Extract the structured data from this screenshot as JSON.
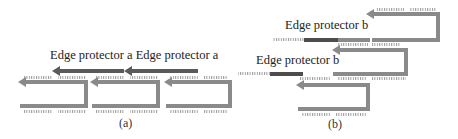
{
  "panel_a": {
    "caption": "(a)",
    "labels": [
      "Edge protector a",
      "Edge protector a"
    ],
    "label_line": "Edge protector a Edge protector a",
    "hairpin_count": 3,
    "protector_count": 2
  },
  "panel_b": {
    "caption": "(b)",
    "labels": [
      "Edge protector b",
      "Edge protector b"
    ],
    "hairpin_count": 3,
    "protector_count": 2
  },
  "colors": {
    "strand": "#8a8a8a",
    "protector_a": "#5a5a5a",
    "protector_b": "#4d4d4d",
    "sticky_end": "#9a9a9a",
    "text": "#222222"
  }
}
